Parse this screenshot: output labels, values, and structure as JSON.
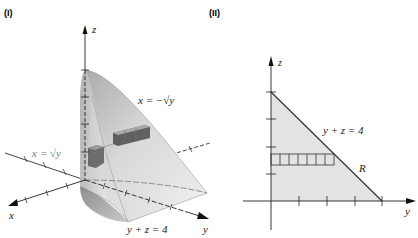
{
  "panels": [
    {
      "id": "I",
      "label": "(I)",
      "type": "3d-solid",
      "axes": {
        "x": "x",
        "y": "y",
        "z": "z"
      },
      "annotations": {
        "surface_left": "x = √y",
        "surface_right": "x = −√y",
        "plane": "y + z = 4"
      }
    },
    {
      "id": "II",
      "label": "(II)",
      "type": "2d-region",
      "axes": {
        "y": "y",
        "z": "z"
      },
      "annotations": {
        "line": "y + z = 4",
        "region": "R"
      },
      "region_vertices": [
        [
          0,
          0
        ],
        [
          4,
          0
        ],
        [
          0,
          4
        ]
      ],
      "strip_cells": 7
    }
  ],
  "text": {
    "panel1_label": "(I)",
    "panel2_label": "(II)",
    "p1_z": "z",
    "p1_x": "x",
    "p1_y": "y",
    "p1_left_eq_lhs": "x",
    "p1_left_eq_rhs": "= √y",
    "p1_right_eq": "x = −√y",
    "p1_plane_eq": "y + z = 4",
    "p2_z": "z",
    "p2_y": "y",
    "p2_line_eq": "y + z = 4",
    "p2_region": "R"
  },
  "colors": {
    "surface_light": "#e6e6e6",
    "surface_mid": "#b8b8b8",
    "surface_dark": "#8c8c8c",
    "region_fill": "#e3e3e3",
    "line": "#333333"
  }
}
